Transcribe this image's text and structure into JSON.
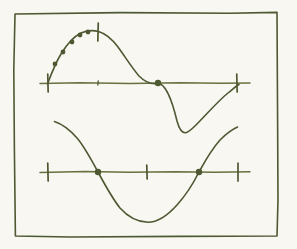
{
  "figure": {
    "title": "Hand-drawn sine and cosine curves",
    "caption": "",
    "background_color": "#f8f7f1",
    "ink_color": "#4e5832",
    "ink_color_light": "#67713f",
    "frame": {
      "name": "hand-drawn-border",
      "stroke_width": 1.6,
      "path": "M 15 14 L 120 12.6 L 230 13.2 L 277 12.4 L 277.6 120 L 278 200 L 277 236 L 180 236.4 L 70 237 L 15.4 236 L 14.4 150 L 13.8 70 Z"
    }
  },
  "chart_data": [
    {
      "id": "upper-plot",
      "type": "line",
      "title": "Sine curve with sampled points on rising arc",
      "xlabel": "",
      "ylabel": "",
      "grid": false,
      "legend": null,
      "axis": {
        "name": "horizontal-axis",
        "y_pixel": 83,
        "x_start": 40,
        "x_end": 250,
        "path": "M 40 83.6 L 80 82.8 L 130 83.4 L 180 82.7 L 220 83.3 L 250 82.9"
      },
      "x_tick_pixels": [
        48,
        98,
        158,
        237
      ],
      "ticks": [
        {
          "name": "tick-left-zero",
          "x": 48,
          "y": 83,
          "half_height": 9,
          "label": "0"
        },
        {
          "name": "tick-peak",
          "x": 98,
          "y": 32,
          "half_height": 9,
          "label": "pi/2"
        },
        {
          "name": "tick-mid-small",
          "x": 98,
          "y": 83,
          "half_height": 2,
          "label": ""
        },
        {
          "name": "tick-right-zero",
          "x": 237,
          "y": 83,
          "half_height": 9,
          "label": "2pi"
        }
      ],
      "curve": {
        "name": "sine-curve",
        "amplitude_pixels": 51,
        "zero_pixels": [
          48,
          158,
          237
        ],
        "peak_pixel": {
          "x": 98,
          "y": 32
        },
        "trough_pixel": {
          "x": 177,
          "y": 122
        },
        "path": "M 47.5 84 C 52 72 56 62 61 54 C 67 44 74 36.5 81 33 C 87 30.5 93 30 98.5 31.5 C 105 33.4 112 39 118 47 C 125 56.5 132 68 139 76 C 145 82 151 84.5 157.5 83.5 C 165 82.4 172 100 177 121 C 182 139 188 133 196 125 C 206 115 218 101 228 93 C 233 89 236 86 239 84.5"
      },
      "points": [
        {
          "name": "sample-point-1",
          "x": 55,
          "y": 64
        },
        {
          "name": "sample-point-2",
          "x": 63,
          "y": 52
        },
        {
          "name": "sample-point-3",
          "x": 72,
          "y": 42
        },
        {
          "name": "sample-point-4",
          "x": 80,
          "y": 35
        },
        {
          "name": "sample-point-5",
          "x": 88,
          "y": 32
        },
        {
          "name": "zero-crossing-point",
          "x": 158,
          "y": 83
        }
      ],
      "point_radius": 2.4,
      "zero_point_radius": 3.2
    },
    {
      "id": "lower-plot",
      "type": "line",
      "title": "Cosine curve with zero crossings marked",
      "xlabel": "",
      "ylabel": "",
      "grid": false,
      "legend": null,
      "axis": {
        "name": "horizontal-axis",
        "y_pixel": 172,
        "x_start": 40,
        "x_end": 250,
        "path": "M 40 172.4 L 85 171.6 L 130 172.3 L 175 171.7 L 215 172.3 L 250 171.8"
      },
      "x_tick_pixels": [
        48,
        98,
        147,
        199,
        238
      ],
      "ticks": [
        {
          "name": "tick-left",
          "x": 48,
          "y": 172,
          "half_height": 9,
          "label": "0"
        },
        {
          "name": "tick-middle",
          "x": 147,
          "y": 172,
          "half_height": 7,
          "label": "pi"
        },
        {
          "name": "tick-right",
          "x": 238,
          "y": 172,
          "half_height": 9,
          "label": "2pi"
        }
      ],
      "curve": {
        "name": "cosine-curve",
        "amplitude_pixels": 50,
        "zero_pixels": [
          98,
          199
        ],
        "start_pixel": {
          "x": 55,
          "y": 122
        },
        "trough_pixel": {
          "x": 148,
          "y": 222
        },
        "end_pixel": {
          "x": 237,
          "y": 128
        },
        "path": "M 54.5 121.5 C 62 124 70 130 77 138 C 84 146 91 159 98 172 C 105 185 112 198 120 208 C 128 217 138 222 148 222.3 C 158 222.2 168 215 177 205 C 186 195 193 184 199 172 C 205 161 212 149 220 140 C 227 133 233 129 237.5 127"
      },
      "points": [
        {
          "name": "zero-crossing-point-left",
          "x": 98,
          "y": 172
        },
        {
          "name": "zero-crossing-point-right",
          "x": 199,
          "y": 172
        }
      ],
      "point_radius": 3.2,
      "zero_point_radius": 3.2
    }
  ]
}
